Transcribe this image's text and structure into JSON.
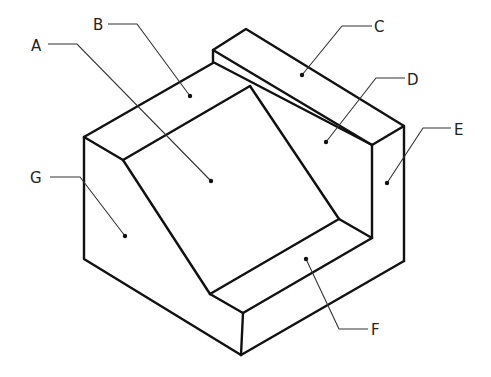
{
  "diagram": {
    "type": "isometric-part-drawing",
    "labels": [
      {
        "id": "A",
        "text": "A",
        "x": 31,
        "y": 51,
        "leader": "48,44 77,44 211,181",
        "dot": [
          211,
          181
        ]
      },
      {
        "id": "B",
        "text": "B",
        "x": 92,
        "y": 30,
        "leader": "108,24 137,24 190,96",
        "dot": [
          190,
          96
        ]
      },
      {
        "id": "C",
        "text": "C",
        "x": 374,
        "y": 32,
        "leader": "372,26 342,26 302,75",
        "dot": [
          302,
          75
        ]
      },
      {
        "id": "D",
        "text": "D",
        "x": 407,
        "y": 86,
        "leader": "405,78 376,78 326,142",
        "dot": [
          326,
          142
        ]
      },
      {
        "id": "E",
        "text": "E",
        "x": 454,
        "y": 136,
        "leader": "451,128 423,128 387,183",
        "dot": [
          387,
          183
        ]
      },
      {
        "id": "F",
        "text": "F",
        "x": 371,
        "y": 335,
        "leader": "368,329 339,329 306,259",
        "dot": [
          306,
          259
        ]
      },
      {
        "id": "G",
        "text": "G",
        "x": 30,
        "y": 185,
        "leader": "50,177 80,177 125,236",
        "dot": [
          125,
          236
        ]
      }
    ]
  }
}
